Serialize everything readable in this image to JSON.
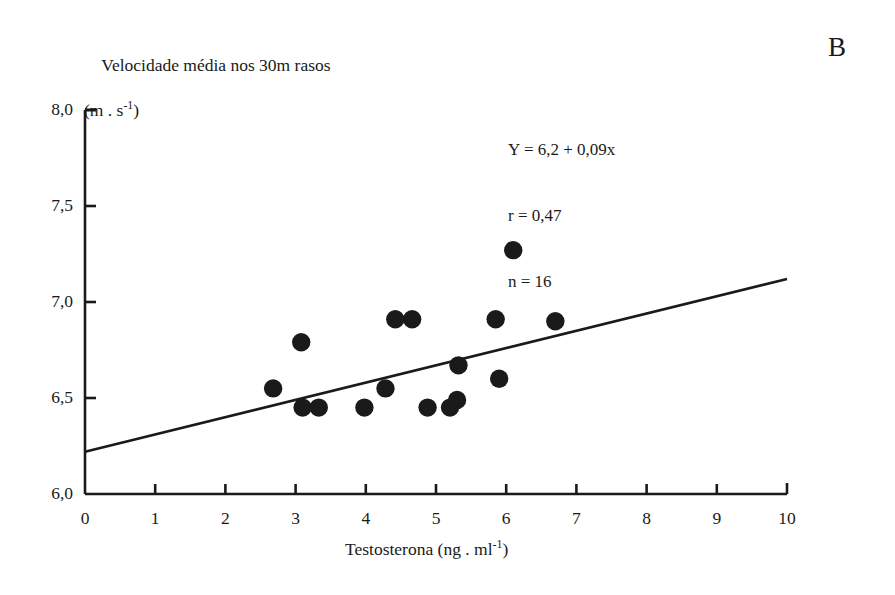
{
  "panel": {
    "label": "B"
  },
  "chart_data": {
    "type": "scatter",
    "title": "",
    "panel_label": "B",
    "ylabel_line1": "Velocidade média nos 30m rasos",
    "ylabel_line2_prefix": "(m . s",
    "ylabel_line2_exp": "-1",
    "ylabel_line2_suffix": ")",
    "xlabel_prefix": "Testosterona (ng . ml",
    "xlabel_exp": "-1",
    "xlabel_suffix": ")",
    "xlim": [
      0,
      10
    ],
    "ylim": [
      6.0,
      8.0
    ],
    "xticks": [
      "0",
      "1",
      "2",
      "3",
      "4",
      "5",
      "6",
      "7",
      "8",
      "9",
      "10"
    ],
    "xtick_values": [
      0,
      1,
      2,
      3,
      4,
      5,
      6,
      7,
      8,
      9,
      10
    ],
    "yticks": [
      "6,0",
      "6,5",
      "7,0",
      "7,5",
      "8,0"
    ],
    "ytick_values": [
      6.0,
      6.5,
      7.0,
      7.5,
      8.0
    ],
    "grid": false,
    "legend": "none",
    "marker_color": "#1a1a1a",
    "line_color": "#1a1a1a",
    "axis_color": "#1a1a1a",
    "points": [
      {
        "x": 2.68,
        "y": 6.55
      },
      {
        "x": 3.08,
        "y": 6.79
      },
      {
        "x": 3.1,
        "y": 6.45
      },
      {
        "x": 3.33,
        "y": 6.45
      },
      {
        "x": 3.98,
        "y": 6.45
      },
      {
        "x": 4.28,
        "y": 6.55
      },
      {
        "x": 4.42,
        "y": 6.91
      },
      {
        "x": 4.66,
        "y": 6.91
      },
      {
        "x": 4.88,
        "y": 6.45
      },
      {
        "x": 5.2,
        "y": 6.45
      },
      {
        "x": 5.3,
        "y": 6.49
      },
      {
        "x": 5.32,
        "y": 6.67
      },
      {
        "x": 5.85,
        "y": 6.91
      },
      {
        "x": 5.9,
        "y": 6.6
      },
      {
        "x": 6.1,
        "y": 7.27
      },
      {
        "x": 6.7,
        "y": 6.9
      }
    ],
    "fit_line": {
      "equation": "Y = 6,2 + 0,09x",
      "intercept": 6.2,
      "slope": 0.09,
      "x_start": 0,
      "x_end": 10,
      "y_start": 6.22,
      "y_end": 7.12
    },
    "annotations": [
      "Y = 6,2 + 0,09x",
      "r = 0,47",
      "n = 16"
    ],
    "statistics": {
      "r": 0.47,
      "n": 16
    }
  }
}
